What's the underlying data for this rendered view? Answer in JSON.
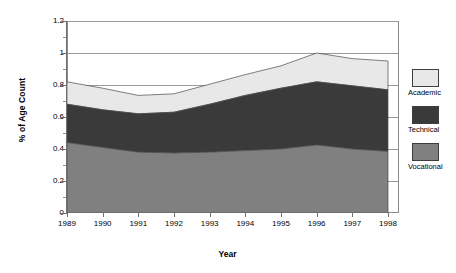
{
  "chart_data": {
    "type": "area",
    "stacked": true,
    "title": "",
    "xlabel": "Year",
    "ylabel": "% of Age Count",
    "categories": [
      "1989",
      "1990",
      "1991",
      "1992",
      "1993",
      "1994",
      "1995",
      "1996",
      "1997",
      "1998"
    ],
    "x": [
      1989,
      1990,
      1991,
      1992,
      1993,
      1994,
      1995,
      1996,
      1997,
      1998
    ],
    "series": [
      {
        "name": "Vocational",
        "color": "#808080",
        "values": [
          0.44,
          0.41,
          0.38,
          0.375,
          0.38,
          0.39,
          0.4,
          0.425,
          0.4,
          0.385
        ]
      },
      {
        "name": "Technical",
        "color": "#3a3a3a",
        "values": [
          0.24,
          0.235,
          0.24,
          0.255,
          0.3,
          0.345,
          0.38,
          0.395,
          0.395,
          0.385
        ]
      },
      {
        "name": "Academic",
        "color": "#e8e8e8",
        "values": [
          0.14,
          0.135,
          0.115,
          0.115,
          0.125,
          0.13,
          0.14,
          0.18,
          0.17,
          0.18
        ]
      }
    ],
    "totals": [
      0.82,
      0.78,
      0.735,
      0.745,
      0.805,
      0.865,
      0.92,
      1.0,
      0.965,
      0.95
    ],
    "ylim": [
      0,
      1.2
    ],
    "yticks": [
      "0",
      "0.2",
      "0.4",
      "0.6",
      "0.8",
      "1",
      "1.2"
    ],
    "ytick_values": [
      0,
      0.2,
      0.4,
      0.6,
      0.8,
      1,
      1.2
    ],
    "yminor_values": [
      0.1,
      0.3,
      0.5,
      0.7,
      0.9,
      1.1
    ],
    "gridlines": [
      0.2,
      0.4,
      0.6,
      0.8,
      1.0,
      1.2
    ],
    "grid": true,
    "legend_position": "right",
    "legend": [
      {
        "label": "Academic",
        "color": "#e8e8e8"
      },
      {
        "label": "Technical",
        "color": "#3a3a3a"
      },
      {
        "label": "Vocational",
        "color": "#808080"
      }
    ]
  }
}
